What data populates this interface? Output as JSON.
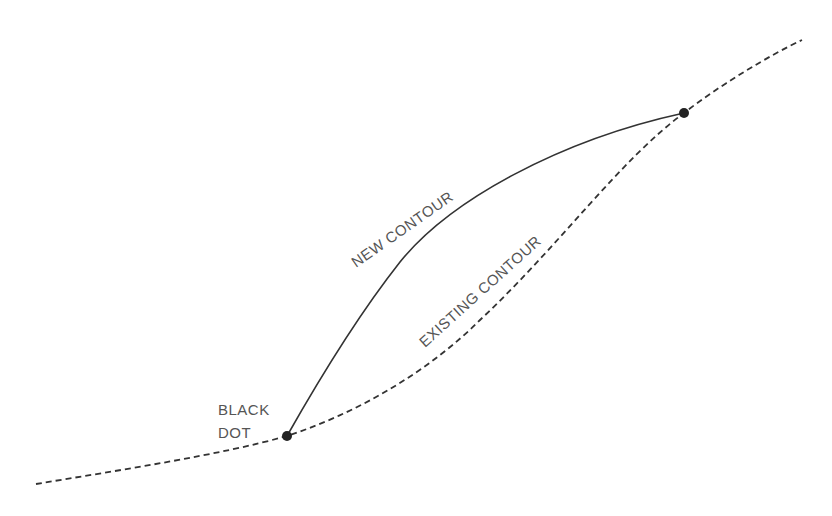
{
  "diagram": {
    "type": "contour-sketch",
    "labels": {
      "new_contour": "NEW CONTOUR",
      "existing_contour": "EXISTING CONTOUR",
      "black_dot_line1": "BLACK",
      "black_dot_line2": "DOT"
    },
    "lines": [
      {
        "name": "existing-contour",
        "style": "dashed",
        "color": "#333333"
      },
      {
        "name": "new-contour",
        "style": "solid",
        "color": "#333333"
      }
    ],
    "points": [
      {
        "name": "black-dot-lower",
        "x": 287,
        "y": 436
      },
      {
        "name": "black-dot-upper",
        "x": 684,
        "y": 113
      }
    ],
    "colors": {
      "line": "#333333",
      "dot": "#222222",
      "text": "#555555",
      "background": "#ffffff"
    }
  }
}
